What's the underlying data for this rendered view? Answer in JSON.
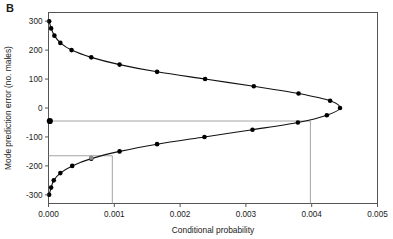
{
  "panel": {
    "label": "B"
  },
  "chart_data": {
    "type": "line",
    "title": "",
    "subtitle": "",
    "xlabel": "Conditional probability",
    "ylabel": "Mode prediction error (no. males)",
    "xlim": [
      0.0,
      0.005
    ],
    "ylim": [
      -330,
      330
    ],
    "xticks": [
      0.0,
      0.001,
      0.002,
      0.003,
      0.004,
      0.005
    ],
    "xticklabels": [
      "0.000",
      "0.001",
      "0.002",
      "0.003",
      "0.004",
      "0.005"
    ],
    "yticks": [
      300,
      200,
      100,
      0,
      -100,
      -200,
      -300
    ],
    "yticklabels": [
      "300",
      "200",
      "100",
      "0",
      "-100",
      "-200",
      "-300"
    ],
    "grid": false,
    "legend": null,
    "marker": "filled-circle",
    "series": [
      {
        "name": "Conditional probability of mode prediction error",
        "points": [
          {
            "x": 1e-05,
            "y": 300
          },
          {
            "x": 4e-05,
            "y": 275
          },
          {
            "x": 9e-05,
            "y": 250
          },
          {
            "x": 0.00018,
            "y": 225
          },
          {
            "x": 0.00035,
            "y": 200
          },
          {
            "x": 0.00065,
            "y": 175
          },
          {
            "x": 0.00108,
            "y": 150
          },
          {
            "x": 0.00165,
            "y": 125
          },
          {
            "x": 0.00238,
            "y": 100
          },
          {
            "x": 0.00312,
            "y": 75
          },
          {
            "x": 0.0038,
            "y": 50
          },
          {
            "x": 0.00428,
            "y": 25
          },
          {
            "x": 0.00443,
            "y": 0
          },
          {
            "x": 0.00423,
            "y": -25
          },
          {
            "x": 0.00379,
            "y": -50
          },
          {
            "x": 0.0031,
            "y": -75
          },
          {
            "x": 0.00237,
            "y": -100
          },
          {
            "x": 0.00165,
            "y": -125
          },
          {
            "x": 0.00108,
            "y": -150
          },
          {
            "x": 0.00065,
            "y": -175
          },
          {
            "x": 0.00036,
            "y": -200
          },
          {
            "x": 0.00018,
            "y": -225
          },
          {
            "x": 8e-05,
            "y": -250
          },
          {
            "x": 4e-05,
            "y": -275
          },
          {
            "x": 1e-05,
            "y": -300
          }
        ]
      }
    ],
    "reference_lines": [
      {
        "orientation": "horizontal",
        "y": -45,
        "x_from": 0.0,
        "x_to": 0.00398,
        "color": "#9a9a9a"
      },
      {
        "orientation": "vertical",
        "x": 0.00398,
        "y_from": -45,
        "y_to": -330,
        "color": "#9a9a9a"
      },
      {
        "orientation": "horizontal",
        "y": -165,
        "x_from": 0.0,
        "x_to": 0.00097,
        "color": "#9a9a9a"
      },
      {
        "orientation": "vertical",
        "x": 0.00097,
        "y_from": -165,
        "y_to": -330,
        "color": "#9a9a9a"
      }
    ],
    "highlight_points": [
      {
        "x": 2e-05,
        "y": -45,
        "style": "large-filled"
      },
      {
        "x": 0.00065,
        "y": -172,
        "style": "gray-filled"
      }
    ],
    "colors": {
      "line": "#111111",
      "marker": "#000000",
      "axis": "#555555",
      "reference": "#9a9a9a",
      "background": "#ffffff"
    }
  }
}
